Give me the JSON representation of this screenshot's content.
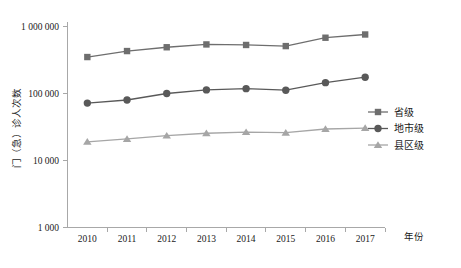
{
  "chart_data": {
    "type": "line",
    "title": "",
    "xlabel": "年份",
    "ylabel": "门（急）诊人次数",
    "x": [
      "2010",
      "2011",
      "2012",
      "2013",
      "2014",
      "2015",
      "2016",
      "2017"
    ],
    "categories": [
      "2010",
      "2011",
      "2012",
      "2013",
      "2014",
      "2015",
      "2016",
      "2017"
    ],
    "yscale": "log",
    "ylim": [
      1000,
      1000000
    ],
    "ytick_labels": [
      "1 000 000",
      "100 000",
      "10 000",
      "1 000"
    ],
    "ytick_values": [
      1000000,
      100000,
      10000,
      1000
    ],
    "grid": false,
    "legend_position": "right",
    "series": [
      {
        "name": "省级",
        "marker": "square",
        "color": "#6e6e6e",
        "values": [
          350000,
          430000,
          490000,
          540000,
          530000,
          510000,
          680000,
          760000
        ]
      },
      {
        "name": "地市级",
        "marker": "circle",
        "color": "#595959",
        "values": [
          72000,
          80000,
          100000,
          113000,
          118000,
          112000,
          145000,
          175000
        ]
      },
      {
        "name": "县区级",
        "marker": "triangle",
        "color": "#a6a6a6",
        "values": [
          19000,
          21000,
          23500,
          25500,
          26500,
          26000,
          29500,
          30500
        ]
      }
    ]
  },
  "legend": {
    "items": [
      {
        "label": "省级"
      },
      {
        "label": "地市级"
      },
      {
        "label": "县区级"
      }
    ]
  },
  "axes": {
    "x_title": "年份",
    "y_title": "门（急）诊人次数"
  }
}
